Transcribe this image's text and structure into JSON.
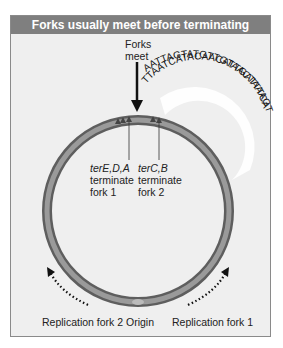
{
  "title": "Forks usually meet before terminating",
  "forks_meet": {
    "line1": "Forks",
    "line2": "meet"
  },
  "dna": {
    "top_strand": "AATTAGTATGTTGTAACTAAAGT",
    "bottom_strand": "TTAATCATACAACATTGATTTCA"
  },
  "terminators": [
    {
      "genes": "terE,D,A",
      "line2": "terminate",
      "line3": "fork 1"
    },
    {
      "genes": "terC,B",
      "line2": "terminate",
      "line3": "fork 2"
    }
  ],
  "bottom_labels": {
    "fork2": "Replication fork 2",
    "origin": "Origin",
    "fork1": "Replication fork 1"
  },
  "colors": {
    "header_bg": "#7f7f7f",
    "panel_bg": "#efefef",
    "chromosome": "#7a7a7a",
    "arrow": "#111111"
  }
}
